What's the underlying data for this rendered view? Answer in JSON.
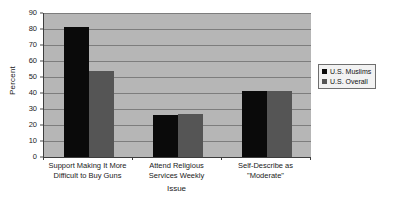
{
  "chart_data": {
    "type": "bar",
    "title": "",
    "xlabel": "Issue",
    "ylabel": "Percent",
    "ylim": [
      0,
      90
    ],
    "ytick_step": 10,
    "yticks": [
      90,
      80,
      70,
      60,
      50,
      40,
      30,
      20,
      10,
      0
    ],
    "grid": true,
    "legend_position": "right",
    "categories": [
      "Support Making It More Difficult to Buy Guns",
      "Attend Religious Services Weekly",
      "Self-Describe as \"Moderate\""
    ],
    "category_lines": [
      [
        "Support Making It More",
        "Difficult to Buy Guns"
      ],
      [
        "Attend Religious",
        "Services Weekly"
      ],
      [
        "Self-Describe as",
        "\"Moderate\""
      ]
    ],
    "series": [
      {
        "name": "U.S. Muslims",
        "color": "#0a0a0a",
        "values": [
          81,
          26,
          41
        ]
      },
      {
        "name": "U.S. Overall",
        "color": "#555555",
        "values": [
          54,
          27,
          41
        ]
      }
    ],
    "plot_background": "#b6b6b6",
    "gridline_color": "#7d7d7d",
    "axis_color": "#3d3d3d"
  }
}
